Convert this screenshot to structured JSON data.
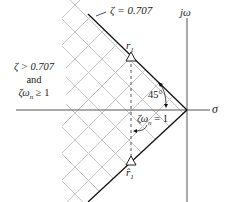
{
  "diagram": {
    "type": "s-plane region diagram",
    "axes": {
      "horizontal_label": "σ",
      "vertical_label": "jω"
    },
    "damping_line_label": "ζ = 0.707",
    "region_label": {
      "line1": "ζ > 0.707",
      "line2": "and",
      "line3": "ζω",
      "line3_sub": "n",
      "line3_rest": " ≥ 1"
    },
    "angle_label": "45°",
    "boundary_label": {
      "prefix": "ζω",
      "sub": "n",
      "suffix": " = 1"
    },
    "poles": [
      {
        "name": "r",
        "sub": "1",
        "accent": ""
      },
      {
        "name": "r̂",
        "sub": "1",
        "accent": "hat"
      }
    ],
    "colors": {
      "axis": "#555555",
      "damping_line": "#111111",
      "hatch": "#b8b8b8",
      "dashed": "#444444",
      "text": "#222222"
    }
  }
}
